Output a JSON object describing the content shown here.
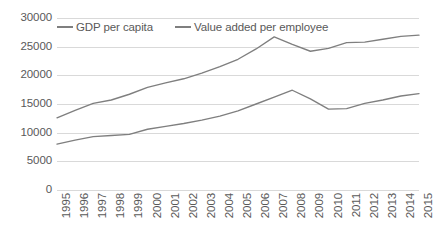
{
  "chart_data": {
    "type": "line",
    "title": "",
    "xlabel": "",
    "ylabel": "",
    "ylim": [
      0,
      30000
    ],
    "y_ticks": [
      "0",
      "5000",
      "10000",
      "15000",
      "20000",
      "25000",
      "30000"
    ],
    "y_tick_values": [
      0,
      5000,
      10000,
      15000,
      20000,
      25000,
      30000
    ],
    "grid": true,
    "legend_position": "top-left",
    "categories": [
      "1995",
      "1996",
      "1997",
      "1998",
      "1999",
      "2000",
      "2001",
      "2002",
      "2003",
      "2004",
      "2005",
      "2006",
      "2007",
      "2008",
      "2009",
      "2010",
      "2011",
      "2012",
      "2013",
      "2014",
      "2015"
    ],
    "series": [
      {
        "name": "GDP per capita",
        "color": "#7f7f7f",
        "values": [
          12600,
          13900,
          15100,
          15700,
          16700,
          17900,
          18700,
          19400,
          20400,
          21500,
          22800,
          24600,
          26700,
          25400,
          24200,
          24700,
          25700,
          25800,
          26300,
          26800,
          27000
        ]
      },
      {
        "name": "Value added per employee",
        "color": "#7f7f7f",
        "values": [
          8000,
          8700,
          9300,
          9500,
          9700,
          10600,
          11100,
          11600,
          12200,
          12900,
          13800,
          15000,
          16200,
          17400,
          15900,
          14100,
          14200,
          15100,
          15700,
          16400,
          16800
        ]
      }
    ]
  },
  "legend": {
    "entries": [
      {
        "label": "GDP per capita"
      },
      {
        "label": "Value added per employee"
      }
    ]
  }
}
